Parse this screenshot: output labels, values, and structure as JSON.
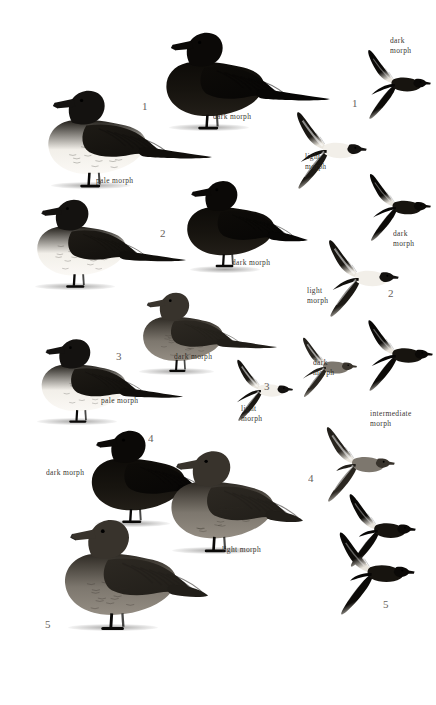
{
  "plate": {
    "width": 436,
    "height": 705,
    "background": "#ffffff",
    "ink": "#151311",
    "label_color": "#2a2622",
    "number_color": "#56514c",
    "mid_gray": "#8d8881",
    "light_gray": "#c9c4bc"
  },
  "species_numbers": [
    {
      "id": "num-1-standing",
      "text": "1",
      "x": 142,
      "y": 100
    },
    {
      "id": "num-2-standing",
      "text": "2",
      "x": 160,
      "y": 227
    },
    {
      "id": "num-3-standing",
      "text": "3",
      "x": 116,
      "y": 350
    },
    {
      "id": "num-4-standing",
      "text": "4",
      "x": 148,
      "y": 432
    },
    {
      "id": "num-5-standing",
      "text": "5",
      "x": 45,
      "y": 618
    },
    {
      "id": "num-1-flight",
      "text": "1",
      "x": 352,
      "y": 97
    },
    {
      "id": "num-2-flight",
      "text": "2",
      "x": 388,
      "y": 287
    },
    {
      "id": "num-3-flight",
      "text": "3",
      "x": 264,
      "y": 380
    },
    {
      "id": "num-4-flight",
      "text": "4",
      "x": 308,
      "y": 472
    },
    {
      "id": "num-5-flight",
      "text": "5",
      "x": 383,
      "y": 598
    }
  ],
  "morph_labels": [
    {
      "id": "label-pale-morph-1",
      "text": "pale morph",
      "x": 96,
      "y": 176
    },
    {
      "id": "label-dark-morph-1",
      "text": "dark morph",
      "x": 213,
      "y": 112
    },
    {
      "id": "label-dark-morph-2",
      "text": "dark morph",
      "x": 232,
      "y": 258
    },
    {
      "id": "label-dark-morph-3",
      "text": "dark morph",
      "x": 174,
      "y": 352
    },
    {
      "id": "label-pale-morph-3",
      "text": "pale morph",
      "x": 101,
      "y": 396
    },
    {
      "id": "label-dark-morph-4",
      "text": "dark morph",
      "x": 46,
      "y": 468
    },
    {
      "id": "label-light-morph-4",
      "text": "light morph",
      "x": 222,
      "y": 545
    },
    {
      "id": "label-dark-morph-flight-1",
      "text": "dark\nmorph",
      "x": 390,
      "y": 36
    },
    {
      "id": "label-light-morph-flight-1",
      "text": "light\nmorph",
      "x": 305,
      "y": 152
    },
    {
      "id": "label-dark-morph-flight-2",
      "text": "dark\nmorph",
      "x": 393,
      "y": 229
    },
    {
      "id": "label-light-morph-flight-2",
      "text": "light\nmorph",
      "x": 307,
      "y": 286
    },
    {
      "id": "label-dark-morph-flight-3",
      "text": "dark\nmorph",
      "x": 313,
      "y": 358
    },
    {
      "id": "label-light-morph-flight-3",
      "text": "light\nmorph",
      "x": 241,
      "y": 404
    },
    {
      "id": "label-intermediate-morph-flight-4",
      "text": "intermediate\nmorph",
      "x": 370,
      "y": 409
    }
  ],
  "standing_birds": [
    {
      "id": "standing-pale-morph-1",
      "name": "standing-bird-pale-morph-jaeger-1",
      "x": 22,
      "y": 80,
      "w": 160,
      "h": 110,
      "tone": "pale",
      "tail": "long"
    },
    {
      "id": "standing-dark-morph-1",
      "name": "standing-bird-dark-morph-jaeger-1",
      "x": 140,
      "y": 22,
      "w": 160,
      "h": 110,
      "tone": "dark",
      "tail": "long"
    },
    {
      "id": "standing-dark-morph-1b",
      "name": "standing-bird-dark-morph-jaeger-1b",
      "x": 6,
      "y": 190,
      "w": 160,
      "h": 100,
      "tone": "pale",
      "tail": "long"
    },
    {
      "id": "standing-dark-morph-2",
      "name": "standing-bird-dark-morph-jaeger-2",
      "x": 165,
      "y": 168,
      "w": 140,
      "h": 105,
      "tone": "dark",
      "tail": "short"
    },
    {
      "id": "standing-dark-morph-3",
      "name": "standing-bird-dark-morph-jaeger-3",
      "x": 112,
      "y": 284,
      "w": 150,
      "h": 90,
      "tone": "mid",
      "tail": "long"
    },
    {
      "id": "standing-pale-morph-3",
      "name": "standing-bird-pale-morph-jaeger-3",
      "x": 8,
      "y": 330,
      "w": 160,
      "h": 95,
      "tone": "pale",
      "tail": "long"
    },
    {
      "id": "standing-dark-morph-4",
      "name": "standing-bird-dark-morph-skua-4",
      "x": 68,
      "y": 418,
      "w": 150,
      "h": 110,
      "tone": "dark",
      "tail": "stout"
    },
    {
      "id": "standing-light-morph-4",
      "name": "standing-bird-light-morph-skua-4",
      "x": 140,
      "y": 440,
      "w": 175,
      "h": 115,
      "tone": "mid",
      "tail": "stout"
    },
    {
      "id": "standing-5",
      "name": "standing-bird-great-skua-5",
      "x": 36,
      "y": 508,
      "w": 180,
      "h": 125,
      "tone": "mid",
      "tail": "stout"
    }
  ],
  "flying_birds": [
    {
      "id": "flight-dark-1",
      "name": "flying-bird-dark-morph-1",
      "x": 360,
      "y": 46,
      "w": 72,
      "h": 76,
      "tone": "dark",
      "tail": "long"
    },
    {
      "id": "flight-light-1",
      "name": "flying-bird-light-morph-1",
      "x": 288,
      "y": 110,
      "w": 80,
      "h": 80,
      "tone": "pale",
      "tail": "long"
    },
    {
      "id": "flight-dark-1b",
      "name": "flying-bird-dark-morph-1b",
      "x": 360,
      "y": 172,
      "w": 74,
      "h": 70,
      "tone": "dark",
      "tail": "long"
    },
    {
      "id": "flight-light-2",
      "name": "flying-bird-light-morph-2",
      "x": 318,
      "y": 238,
      "w": 84,
      "h": 80,
      "tone": "pale",
      "tail": "long"
    },
    {
      "id": "flight-dark-2",
      "name": "flying-bird-dark-morph-2",
      "x": 360,
      "y": 318,
      "w": 74,
      "h": 74,
      "tone": "dark",
      "tail": "long"
    },
    {
      "id": "flight-light-3",
      "name": "flying-bird-light-morph-3",
      "x": 222,
      "y": 358,
      "w": 80,
      "h": 64,
      "tone": "pale",
      "tail": "pin"
    },
    {
      "id": "flight-dark-3",
      "name": "flying-bird-dark-morph-3",
      "x": 288,
      "y": 336,
      "w": 78,
      "h": 62,
      "tone": "mid",
      "tail": "pin"
    },
    {
      "id": "flight-inter-4",
      "name": "flying-bird-intermediate-morph-4",
      "x": 318,
      "y": 424,
      "w": 78,
      "h": 80,
      "tone": "mid",
      "tail": "stout"
    },
    {
      "id": "flight-dark-4",
      "name": "flying-bird-dark-morph-4",
      "x": 340,
      "y": 492,
      "w": 78,
      "h": 76,
      "tone": "dark",
      "tail": "stout"
    },
    {
      "id": "flight-5",
      "name": "flying-bird-great-skua-5",
      "x": 330,
      "y": 530,
      "w": 86,
      "h": 86,
      "tone": "dark",
      "tail": "stout"
    }
  ]
}
